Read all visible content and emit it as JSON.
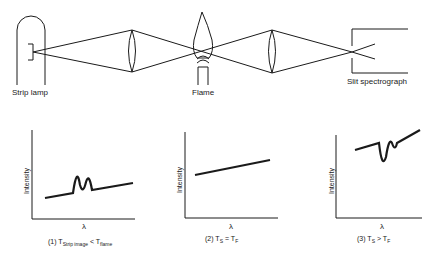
{
  "diagram": {
    "components": [
      {
        "id": "strip-lamp",
        "label": "Strip lamp"
      },
      {
        "id": "lens-1",
        "label": ""
      },
      {
        "id": "flame",
        "label": "Flame"
      },
      {
        "id": "lens-2",
        "label": ""
      },
      {
        "id": "slit-spectrograph",
        "label": "Slit spectrograph"
      }
    ],
    "colors": {
      "line": "#1a1a1a",
      "background": "#ffffff"
    }
  },
  "plots": [
    {
      "ylabel": "Intensity",
      "xlabel": "λ",
      "caption_prefix": "(1) T",
      "caption_sub1": "Strip image",
      "caption_mid": " < T",
      "caption_sub2": "flame",
      "feature": "emission peaks"
    },
    {
      "ylabel": "Intensity",
      "xlabel": "λ",
      "caption_prefix": "(2) T",
      "caption_sub1": "S",
      "caption_mid": " = T",
      "caption_sub2": "F",
      "feature": "flat continuum"
    },
    {
      "ylabel": "Intensity",
      "xlabel": "λ",
      "caption_prefix": "(3) T",
      "caption_sub1": "S",
      "caption_mid": " > T",
      "caption_sub2": "F",
      "feature": "absorption dips"
    }
  ]
}
